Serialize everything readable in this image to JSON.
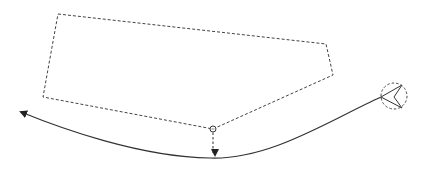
{
  "diagram": {
    "width": 425,
    "height": 171,
    "background": "#ffffff",
    "stroke_color": "#333333",
    "region_polygon": {
      "points": [
        [
          58,
          14
        ],
        [
          326,
          44
        ],
        [
          333,
          75
        ],
        [
          213,
          129
        ],
        [
          43,
          97
        ]
      ],
      "style": "dashed"
    },
    "waypoint_node": {
      "cx": 213,
      "cy": 129,
      "r": 3
    },
    "drop_arrow": {
      "x": 213,
      "y1": 132,
      "y2": 154,
      "style": "dashed"
    },
    "path_curve": {
      "start": [
        378,
        97
      ],
      "end": [
        18,
        111
      ],
      "style": "solid",
      "arrowhead": "end"
    },
    "vehicle_marker": {
      "cx": 394,
      "cy": 96,
      "r": 13,
      "style": "dashed",
      "icon": "chevron-left-icon"
    }
  }
}
